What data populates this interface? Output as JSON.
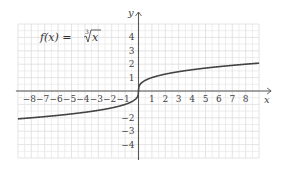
{
  "chart_data": {
    "type": "line",
    "function": "cube root",
    "xlabel": "x",
    "ylabel": "y",
    "xlim": [
      -9,
      9
    ],
    "ylim": [
      -5,
      5
    ],
    "grid": true,
    "x_ticks": [
      -8,
      -7,
      -6,
      -5,
      -4,
      -3,
      -2,
      -1,
      1,
      2,
      3,
      4,
      5,
      6,
      7,
      8
    ],
    "y_ticks": [
      -4,
      -3,
      -2,
      1,
      2,
      3,
      4
    ],
    "x_tick_labels": [
      "−8",
      "−7",
      "−6",
      "−5",
      "−4",
      "−3",
      "−2",
      "−1",
      "1",
      "2",
      "3",
      "4",
      "5",
      "6",
      "7",
      "8"
    ],
    "y_tick_labels": [
      "−4",
      "−3",
      "−2",
      "1",
      "2",
      "3",
      "4"
    ],
    "series": [
      {
        "name": "f(x) = ∛x",
        "x": [
          -9,
          -8,
          -6,
          -4,
          -2,
          -1,
          -0.5,
          -0.125,
          0,
          0.125,
          0.5,
          1,
          2,
          4,
          6,
          8,
          9
        ],
        "values": [
          -2.08,
          -2,
          -1.82,
          -1.59,
          -1.26,
          -1,
          -0.79,
          -0.5,
          0,
          0.5,
          0.79,
          1,
          1.26,
          1.59,
          1.82,
          2,
          2.08
        ]
      }
    ]
  },
  "labels": {
    "title_prefix": "f(x) = ",
    "title_index": "3",
    "title_radicand": "x",
    "x_axis": "x",
    "y_axis": "y"
  },
  "colors": {
    "grid": "#dddddd",
    "axis": "#555555",
    "curve": "#444444",
    "text": "#444444"
  }
}
